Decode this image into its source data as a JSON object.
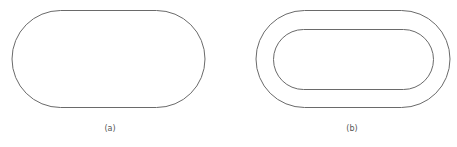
{
  "figures": [
    {
      "id": "a",
      "caption": "(a)",
      "shapes": [
        {
          "type": "stadium",
          "x": 12,
          "y": 10.5,
          "width": 193,
          "height": 97
        }
      ]
    },
    {
      "id": "b",
      "caption": "(b)",
      "shapes": [
        {
          "type": "stadium",
          "x": 256,
          "y": 10.5,
          "width": 194,
          "height": 97
        },
        {
          "type": "stadium",
          "x": 273.5,
          "y": 29.5,
          "width": 160,
          "height": 60
        }
      ]
    }
  ],
  "style": {
    "stroke_color": "#6a6a6a",
    "caption_color": "#555555"
  }
}
